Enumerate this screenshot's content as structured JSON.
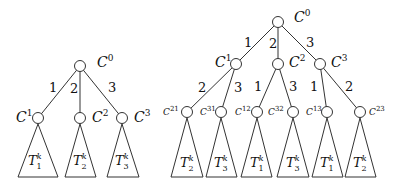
{
  "diagram": {
    "left_tree": {
      "root": {
        "label": "C",
        "sup": "0",
        "x": 80,
        "y": 66
      },
      "edges": [
        {
          "label": "1",
          "to": 0
        },
        {
          "label": "2",
          "to": 1
        },
        {
          "label": "3",
          "to": 2
        }
      ],
      "children": [
        {
          "label": "C",
          "sup": "1",
          "x": 38,
          "y": 118,
          "subtree": {
            "T": "T",
            "sub": "1",
            "sup": "k"
          }
        },
        {
          "label": "C",
          "sup": "2",
          "x": 80,
          "y": 118,
          "subtree": {
            "T": "T",
            "sub": "2",
            "sup": "k"
          }
        },
        {
          "label": "C",
          "sup": "3",
          "x": 122,
          "y": 118,
          "subtree": {
            "T": "T",
            "sub": "3",
            "sup": "k"
          }
        }
      ]
    },
    "right_tree": {
      "root": {
        "label": "C",
        "sup": "0",
        "x": 278,
        "y": 22
      },
      "level1": [
        {
          "label": "C",
          "sup": "1",
          "edge": "1",
          "x": 236,
          "y": 64
        },
        {
          "label": "C",
          "sup": "2",
          "edge": "2",
          "x": 278,
          "y": 64
        },
        {
          "label": "C",
          "sup": "3",
          "edge": "3",
          "x": 320,
          "y": 64
        }
      ],
      "level2": [
        {
          "label": "C",
          "sup": "21",
          "edge": "2",
          "parent": 0,
          "x": 187,
          "y": 112,
          "subtree": {
            "T": "T",
            "sub": "2",
            "sup": "k"
          }
        },
        {
          "label": "C",
          "sup": "31",
          "edge": "3",
          "parent": 0,
          "x": 221,
          "y": 112,
          "subtree": {
            "T": "T",
            "sub": "3",
            "sup": "k"
          }
        },
        {
          "label": "C",
          "sup": "12",
          "edge": "1",
          "parent": 1,
          "x": 257,
          "y": 112,
          "subtree": {
            "T": "T",
            "sub": "1",
            "sup": "k"
          }
        },
        {
          "label": "C",
          "sup": "32",
          "edge": "3",
          "parent": 1,
          "x": 293,
          "y": 112,
          "subtree": {
            "T": "T",
            "sub": "3",
            "sup": "k"
          }
        },
        {
          "label": "C",
          "sup": "13",
          "edge": "1",
          "parent": 2,
          "x": 327,
          "y": 112,
          "subtree": {
            "T": "T",
            "sub": "1",
            "sup": "k"
          }
        },
        {
          "label": "C",
          "sup": "23",
          "edge": "2",
          "parent": 2,
          "x": 360,
          "y": 112,
          "subtree": {
            "T": "T",
            "sub": "2",
            "sup": "k"
          }
        }
      ]
    }
  }
}
